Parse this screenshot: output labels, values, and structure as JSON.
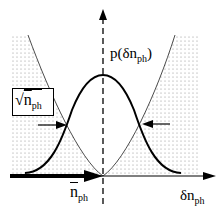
{
  "diagram": {
    "labels": {
      "distribution": {
        "main": "p(δn",
        "sub": "ph",
        "close": ")"
      },
      "mean": {
        "main": "n",
        "sub": "ph"
      },
      "axis": {
        "main": "δn",
        "sub": "ph"
      },
      "width_box": {
        "root": "√",
        "main": "n",
        "sub": "ph"
      }
    },
    "colors": {
      "ink": "#000000",
      "shading_dot": "#9a9a9a",
      "background": "#ffffff"
    }
  }
}
